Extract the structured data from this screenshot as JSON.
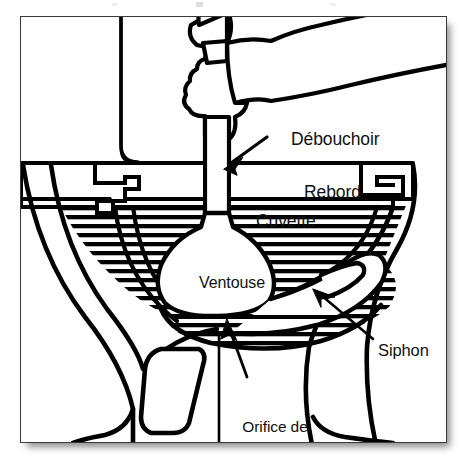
{
  "figure": {
    "type": "technical-line-diagram",
    "language": "fr",
    "frame": {
      "border_color": "#3a3a3a",
      "background": "#ffffff",
      "has_drop_shadow": true
    },
    "ink_color": "#000000",
    "labels": [
      {
        "key": "debouchoir",
        "text": "Débouchoir",
        "has_leader_arrow": true,
        "arrow_direction": "down-left"
      },
      {
        "key": "rebord",
        "text": "Rebord",
        "has_leader_arrow": false
      },
      {
        "key": "cuvette",
        "text": "Cuvette",
        "has_leader_arrow": false
      },
      {
        "key": "ventouse",
        "text": "Ventouse",
        "has_leader_arrow": false
      },
      {
        "key": "siphon",
        "text": "Siphon",
        "has_leader_arrow": true,
        "arrow_direction": "up-left"
      },
      {
        "key": "orifice",
        "lines": [
          "Orifice de",
          "vidange de la",
          "toilette"
        ],
        "has_leader_arrow": true,
        "arrow_direction": "up-left"
      }
    ],
    "label_text": {
      "debouchoir": "Débouchoir",
      "rebord": "Rebord",
      "cuvette": "Cuvette",
      "ventouse": "Ventouse",
      "siphon": "Siphon",
      "orifice_line1": "Orifice de",
      "orifice_line2": "vidange de la",
      "orifice_line3": "toilette"
    },
    "parts_depicted": [
      "hand gripping plunger handle",
      "plunger handle (shaft)",
      "plunger cup (ventouse)",
      "toilet rim (rebord)",
      "toilet bowl (cuvette)",
      "water hatching in bowl",
      "trap / siphon",
      "flush outlet (orifice de vidange)",
      "pedestal base"
    ]
  }
}
